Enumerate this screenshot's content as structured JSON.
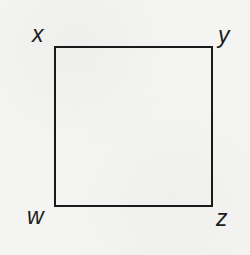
{
  "figure": {
    "shape": "square",
    "line_color": "#1a1a1a",
    "background_color": "#f4f4f2",
    "vertices": [
      {
        "id": "top-left",
        "label": "x"
      },
      {
        "id": "top-right",
        "label": "y"
      },
      {
        "id": "bottom-left",
        "label": "w"
      },
      {
        "id": "bottom-right",
        "label": "z"
      }
    ]
  }
}
